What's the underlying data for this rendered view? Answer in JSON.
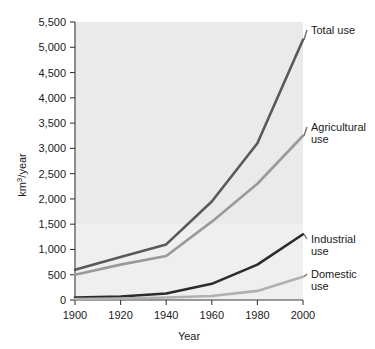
{
  "chart_data": {
    "type": "line",
    "title": "",
    "xlabel": "Year",
    "ylabel": "km3/year",
    "ylabel_display": "km",
    "ylabel_sup": "3",
    "ylabel_tail": "/year",
    "x": [
      1900,
      1920,
      1940,
      1960,
      1980,
      2000
    ],
    "xticklabels": [
      "1900",
      "1920",
      "1940",
      "1960",
      "1980",
      "2000"
    ],
    "xlim": [
      1900,
      2000
    ],
    "ylim": [
      0,
      5500
    ],
    "yticks": [
      0,
      500,
      1000,
      1500,
      2000,
      2500,
      3000,
      3500,
      4000,
      4500,
      5000,
      5500
    ],
    "yticklabels": [
      "0",
      "500",
      "1,000",
      "1,500",
      "2,000",
      "2,500",
      "3,000",
      "3,500",
      "4,000",
      "4,500",
      "5,000",
      "5,500"
    ],
    "grid": false,
    "legend_position": "right-inline-labels",
    "plot_background": "#eaeaea",
    "plot_background_lower": "#efefef",
    "series": [
      {
        "name": "Total use",
        "label_line1": "Total use",
        "label_line2": "",
        "color": "#595959",
        "width": 2.6,
        "values": [
          600,
          850,
          1100,
          1950,
          3100,
          5150
        ]
      },
      {
        "name": "Agricultural use",
        "label_line1": "Agricultural",
        "label_line2": "use",
        "color": "#9a9a9a",
        "width": 2.6,
        "values": [
          500,
          700,
          870,
          1550,
          2300,
          3250
        ]
      },
      {
        "name": "Industrial use",
        "label_line1": "Industrial",
        "label_line2": "use",
        "color": "#2b2b2b",
        "width": 2.6,
        "values": [
          50,
          70,
          130,
          320,
          700,
          1300
        ]
      },
      {
        "name": "Domestic use",
        "label_line1": "Domestic",
        "label_line2": "use",
        "color": "#b0b0b0",
        "width": 2.6,
        "values": [
          20,
          30,
          50,
          80,
          180,
          460
        ]
      }
    ]
  }
}
